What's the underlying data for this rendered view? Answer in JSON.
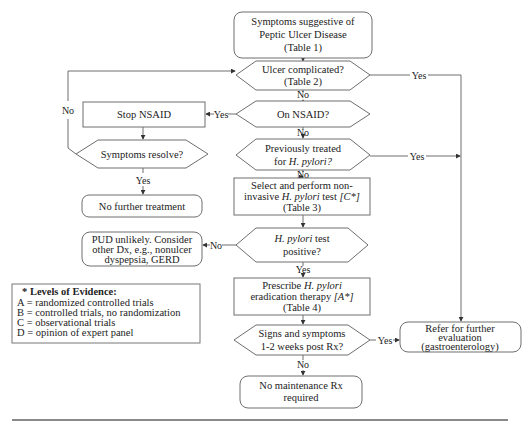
{
  "flowchart": {
    "nodes": {
      "start": {
        "lines": [
          "Symptoms suggestive of",
          "Peptic Ulcer Disease",
          "(Table 1)"
        ]
      },
      "ulcer_complicated": {
        "lines": [
          "Ulcer complicated?",
          "(Table 2)"
        ]
      },
      "on_nsaid": {
        "lines": [
          "On NSAID?"
        ]
      },
      "stop_nsaid": {
        "lines": [
          "Stop NSAID"
        ]
      },
      "symptoms_resolve": {
        "lines": [
          "Symptoms resolve?"
        ]
      },
      "no_further_treatment": {
        "lines": [
          "No further treatment"
        ]
      },
      "previously_treated": {
        "line1": "Previously treated",
        "line2_prefix": "for ",
        "line2_italic": "H. pylori?"
      },
      "select_test": {
        "line1": "Select and perform non-",
        "line2_prefix": "invasive ",
        "line2_italic": "H. pylori",
        "line2_mid": " test ",
        "line2_grade": "[C*]",
        "line3": "(Table 3)"
      },
      "test_positive": {
        "line1_italic": "H. pylori",
        "line1_suffix": " test",
        "line2": "positive?"
      },
      "pud_unlikely": {
        "lines": [
          "PUD unlikely. Consider",
          "other Dx, e.g., nonulcer",
          "dyspepsia, GERD"
        ]
      },
      "prescribe": {
        "line1_prefix": "Prescribe ",
        "line1_italic": "H. pylori",
        "line2": "eradication therapy ",
        "line2_grade": "[A*]",
        "line3": "(Table 4)"
      },
      "signs_post_rx": {
        "lines": [
          "Signs and symptoms",
          "1-2 weeks post Rx?"
        ]
      },
      "refer": {
        "lines": [
          "Refer for further",
          "evaluation",
          "(gastroenterology)"
        ]
      },
      "no_maintenance": {
        "lines": [
          "No maintenance Rx",
          "required"
        ]
      }
    },
    "edge_labels": {
      "yes": "Yes",
      "no": "No"
    },
    "legend": {
      "title": "* Levels of Evidence:",
      "items": [
        "A = randomized controlled trials",
        "B = controlled trials, no randomization",
        "C = observational trials",
        "D = opinion of expert panel"
      ]
    },
    "colors": {
      "stroke": "#6e6e6e",
      "text": "#222222",
      "background": "#ffffff"
    }
  }
}
